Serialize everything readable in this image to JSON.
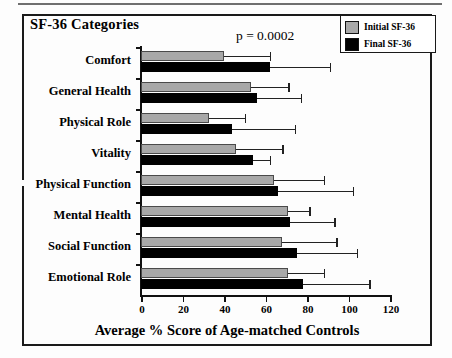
{
  "chart_data": {
    "type": "bar",
    "orientation": "horizontal",
    "title": "SF-36 Categories",
    "xlabel": "Average % Score of Age-matched Controls",
    "ylabel": "SF-36 Categories",
    "xlim": [
      0,
      120
    ],
    "xticks": [
      0,
      20,
      40,
      60,
      80,
      100,
      120
    ],
    "xtick_labels": [
      "0",
      "20",
      "40",
      "60",
      "80",
      "100",
      "120"
    ],
    "grid": false,
    "legend_position": "top-right",
    "annotation": "p = 0.0002",
    "categories": [
      "Comfort",
      "General Health",
      "Physical Role",
      "Vitality",
      "Physical Function",
      "Mental Health",
      "Social Function",
      "Emotional Role"
    ],
    "series": [
      {
        "name": "Initial SF-36",
        "color": "#a8a8a8",
        "values": [
          40,
          53,
          33,
          46,
          64,
          71,
          68,
          71
        ],
        "error_upper": [
          62,
          71,
          50,
          68,
          88,
          81,
          94,
          88
        ]
      },
      {
        "name": "Final SF-36",
        "color": "#000000",
        "values": [
          62,
          56,
          44,
          54,
          66,
          72,
          75,
          78
        ],
        "error_upper": [
          91,
          77,
          74,
          62,
          102,
          93,
          104,
          110
        ]
      }
    ]
  },
  "chart": {
    "title": "SF-36 Categories",
    "pvalue": "p = 0.0002",
    "xaxis_title": "Average % Score of Age-matched Controls",
    "legend": [
      {
        "label": "Initial SF-36",
        "swatch": "initial"
      },
      {
        "label": "Final SF-36",
        "swatch": "final"
      }
    ]
  }
}
